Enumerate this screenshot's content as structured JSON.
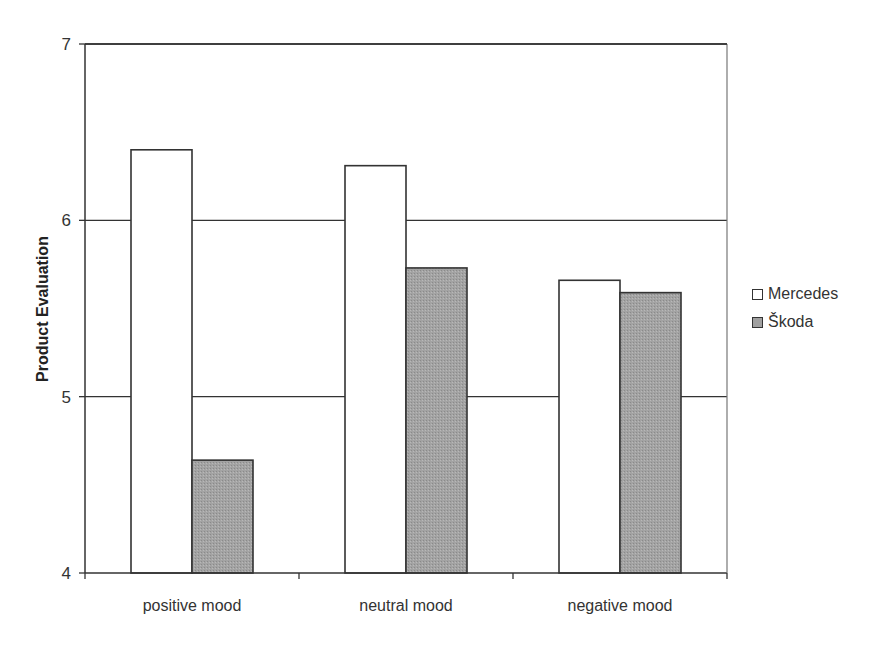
{
  "chart_data": {
    "type": "bar",
    "title": "",
    "xlabel": "",
    "ylabel": "Product Evaluation",
    "ylim": [
      4,
      7
    ],
    "yticks": [
      4,
      5,
      6,
      7
    ],
    "grid": true,
    "legend_position": "right",
    "categories": [
      "positive mood",
      "neutral mood",
      "negative mood"
    ],
    "series": [
      {
        "name": "Mercedes",
        "color": "#ffffff",
        "values": [
          6.4,
          6.31,
          5.66
        ]
      },
      {
        "name": "Škoda",
        "color": "#a0a0a0",
        "values": [
          4.64,
          5.73,
          5.59
        ]
      }
    ]
  },
  "axis": {
    "ylabel": "Product Evaluation",
    "yticks": [
      "4",
      "5",
      "6",
      "7"
    ]
  },
  "legend": {
    "items": [
      {
        "label": "Mercedes",
        "color": "#ffffff"
      },
      {
        "label": "Škoda",
        "color": "#a0a0a0"
      }
    ]
  }
}
